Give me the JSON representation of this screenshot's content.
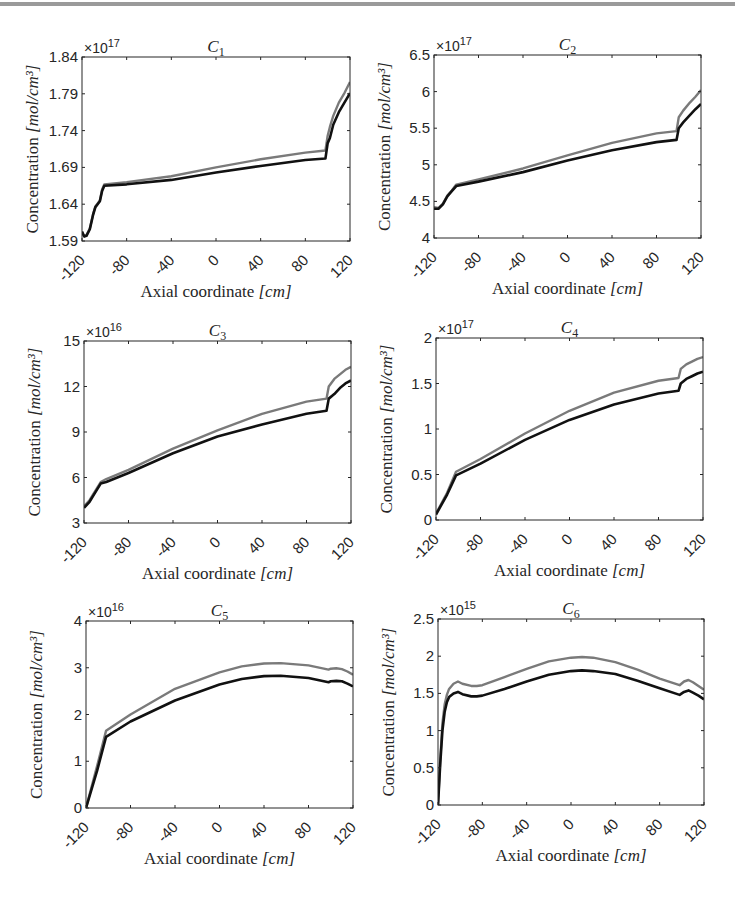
{
  "figure": {
    "xlabel": "Axial coordinate [cm]",
    "xlabel_main": "Axial coordinate ",
    "xlabel_unit": "[cm]",
    "ylabel": "Concentration [mol/cm³]",
    "ylabel_main": "Concentration ",
    "ylabel_unit": "[mol/cm³]",
    "series_colors": {
      "upper": "#7a7a7a",
      "lower": "#111111"
    }
  },
  "chart_data": [
    {
      "type": "line",
      "title": "C1",
      "title_sub": "1",
      "xlabel": "Axial coordinate [cm]",
      "ylabel": "Concentration [mol/cm^3]",
      "exponent": "×10^17",
      "exp_power": "17",
      "xlim": [
        -120,
        120
      ],
      "ylim": [
        1.59,
        1.84
      ],
      "xticks": [
        -120,
        -80,
        -40,
        0,
        40,
        80,
        120
      ],
      "yticks": [
        1.59,
        1.64,
        1.69,
        1.74,
        1.79,
        1.84
      ],
      "ytick_labels": [
        "1.59",
        "1.64",
        "1.69",
        "1.74",
        "1.79",
        "1.84"
      ],
      "box": [
        82,
        57,
        350,
        241
      ],
      "series": [
        {
          "name": "upper (gray)",
          "color": "#7a7a7a",
          "x": [
            -120,
            -118,
            -116,
            -113,
            -110,
            -108,
            -106,
            -104,
            -102,
            -100,
            -80,
            -40,
            0,
            40,
            80,
            98,
            100,
            102,
            105,
            110,
            115,
            120
          ],
          "y": [
            1.601,
            1.597,
            1.598,
            1.607,
            1.627,
            1.637,
            1.641,
            1.645,
            1.66,
            1.667,
            1.67,
            1.678,
            1.69,
            1.701,
            1.71,
            1.713,
            1.733,
            1.745,
            1.76,
            1.778,
            1.791,
            1.806
          ]
        },
        {
          "name": "lower (black)",
          "color": "#111111",
          "x": [
            -120,
            -118,
            -116,
            -113,
            -110,
            -108,
            -106,
            -104,
            -102,
            -100,
            -80,
            -40,
            0,
            40,
            80,
            98,
            100,
            102,
            105,
            110,
            115,
            120
          ],
          "y": [
            1.603,
            1.596,
            1.597,
            1.606,
            1.626,
            1.636,
            1.64,
            1.644,
            1.658,
            1.665,
            1.667,
            1.673,
            1.683,
            1.692,
            1.7,
            1.702,
            1.723,
            1.73,
            1.748,
            1.765,
            1.778,
            1.791
          ]
        }
      ]
    },
    {
      "type": "line",
      "title": "C2",
      "title_sub": "2",
      "xlabel": "Axial coordinate [cm]",
      "ylabel": "Concentration [mol/cm^3]",
      "exponent": "×10^17",
      "exp_power": "17",
      "xlim": [
        -120,
        120
      ],
      "ylim": [
        4,
        6.5
      ],
      "xticks": [
        -120,
        -80,
        -40,
        0,
        40,
        80,
        120
      ],
      "yticks": [
        4,
        4.5,
        5,
        5.5,
        6,
        6.5
      ],
      "ytick_labels": [
        "4",
        "4.5",
        "5",
        "5.5",
        "6",
        "6.5"
      ],
      "box": [
        434,
        55,
        701,
        238
      ],
      "series": [
        {
          "name": "upper (gray)",
          "color": "#7a7a7a",
          "x": [
            -120,
            -116,
            -112,
            -108,
            -104,
            -100,
            -80,
            -40,
            0,
            40,
            80,
            98,
            100,
            104,
            110,
            115,
            120
          ],
          "y": [
            4.42,
            4.41,
            4.47,
            4.58,
            4.65,
            4.73,
            4.8,
            4.95,
            5.13,
            5.3,
            5.43,
            5.46,
            5.65,
            5.74,
            5.85,
            5.93,
            6.02
          ]
        },
        {
          "name": "lower (black)",
          "color": "#111111",
          "x": [
            -120,
            -116,
            -112,
            -108,
            -104,
            -100,
            -80,
            -40,
            0,
            40,
            80,
            98,
            100,
            104,
            110,
            115,
            120
          ],
          "y": [
            4.4,
            4.4,
            4.46,
            4.57,
            4.64,
            4.71,
            4.77,
            4.9,
            5.06,
            5.2,
            5.31,
            5.34,
            5.5,
            5.58,
            5.68,
            5.76,
            5.83
          ]
        }
      ]
    },
    {
      "type": "line",
      "title": "C3",
      "title_sub": "3",
      "xlabel": "Axial coordinate [cm]",
      "ylabel": "Concentration [mol/cm^3]",
      "exponent": "×10^16",
      "exp_power": "16",
      "xlim": [
        -120,
        120
      ],
      "ylim": [
        3,
        15
      ],
      "xticks": [
        -120,
        -80,
        -40,
        0,
        40,
        80,
        120
      ],
      "yticks": [
        3,
        6,
        9,
        12,
        15
      ],
      "ytick_labels": [
        "3",
        "6",
        "9",
        "12",
        "15"
      ],
      "box": [
        84,
        341,
        351,
        523
      ],
      "series": [
        {
          "name": "upper (gray)",
          "color": "#7a7a7a",
          "x": [
            -120,
            -115,
            -110,
            -105,
            -100,
            -80,
            -40,
            0,
            40,
            80,
            98,
            100,
            105,
            110,
            115,
            120
          ],
          "y": [
            4.1,
            4.5,
            5.1,
            5.7,
            5.9,
            6.5,
            7.9,
            9.1,
            10.2,
            11.0,
            11.2,
            12.0,
            12.5,
            12.8,
            13.1,
            13.3
          ]
        },
        {
          "name": "lower (black)",
          "color": "#111111",
          "x": [
            -120,
            -115,
            -110,
            -105,
            -100,
            -80,
            -40,
            0,
            40,
            80,
            98,
            100,
            105,
            110,
            115,
            120
          ],
          "y": [
            4.0,
            4.4,
            5.0,
            5.6,
            5.7,
            6.3,
            7.6,
            8.7,
            9.5,
            10.2,
            10.4,
            11.2,
            11.5,
            11.9,
            12.2,
            12.4
          ]
        }
      ]
    },
    {
      "type": "line",
      "title": "C4",
      "title_sub": "4",
      "xlabel": "Axial coordinate [cm]",
      "ylabel": "Concentration [mol/cm^3]",
      "exponent": "×10^17",
      "exp_power": "17",
      "xlim": [
        -120,
        120
      ],
      "ylim": [
        0,
        2
      ],
      "xticks": [
        -120,
        -80,
        -40,
        0,
        40,
        80,
        120
      ],
      "yticks": [
        0,
        0.5,
        1,
        1.5,
        2
      ],
      "ytick_labels": [
        "0",
        "0.5",
        "1",
        "1.5",
        "2"
      ],
      "box": [
        436,
        338,
        703,
        520
      ],
      "series": [
        {
          "name": "upper (gray)",
          "color": "#7a7a7a",
          "x": [
            -120,
            -110,
            -102,
            -80,
            -40,
            0,
            40,
            80,
            98,
            100,
            105,
            110,
            115,
            120
          ],
          "y": [
            0.07,
            0.3,
            0.53,
            0.67,
            0.95,
            1.2,
            1.4,
            1.53,
            1.56,
            1.66,
            1.71,
            1.74,
            1.77,
            1.79
          ]
        },
        {
          "name": "lower (black)",
          "color": "#111111",
          "x": [
            -120,
            -110,
            -102,
            -80,
            -40,
            0,
            40,
            80,
            98,
            100,
            105,
            110,
            115,
            120
          ],
          "y": [
            0.06,
            0.28,
            0.49,
            0.62,
            0.88,
            1.1,
            1.27,
            1.39,
            1.42,
            1.5,
            1.55,
            1.58,
            1.61,
            1.63
          ]
        }
      ]
    },
    {
      "type": "line",
      "title": "C5",
      "title_sub": "5",
      "xlabel": "Axial coordinate [cm]",
      "ylabel": "Concentration [mol/cm^3]",
      "exponent": "×10^16",
      "exp_power": "16",
      "xlim": [
        -120,
        120
      ],
      "ylim": [
        0,
        4
      ],
      "xticks": [
        -120,
        -80,
        -40,
        0,
        40,
        80,
        120
      ],
      "yticks": [
        0,
        1,
        2,
        3,
        4
      ],
      "ytick_labels": [
        "0",
        "1",
        "2",
        "3",
        "4"
      ],
      "box": [
        86,
        621,
        353,
        808
      ],
      "series": [
        {
          "name": "upper (gray)",
          "color": "#7a7a7a",
          "x": [
            -120,
            -110,
            -102,
            -80,
            -40,
            0,
            20,
            40,
            55,
            80,
            98,
            100,
            105,
            110,
            115,
            120
          ],
          "y": [
            0.0,
            0.9,
            1.65,
            2.0,
            2.55,
            2.9,
            3.03,
            3.09,
            3.1,
            3.05,
            2.96,
            2.98,
            2.99,
            2.97,
            2.92,
            2.85
          ]
        },
        {
          "name": "lower (black)",
          "color": "#111111",
          "x": [
            -120,
            -110,
            -102,
            -80,
            -40,
            0,
            20,
            40,
            55,
            80,
            98,
            100,
            105,
            110,
            115,
            120
          ],
          "y": [
            0.0,
            0.8,
            1.52,
            1.85,
            2.3,
            2.64,
            2.76,
            2.82,
            2.83,
            2.78,
            2.69,
            2.71,
            2.72,
            2.71,
            2.66,
            2.6
          ]
        }
      ]
    },
    {
      "type": "line",
      "title": "C6",
      "title_sub": "6",
      "xlabel": "Axial coordinate [cm]",
      "ylabel": "Concentration [mol/cm^3]",
      "exponent": "×10^15",
      "exp_power": "15",
      "xlim": [
        -120,
        120
      ],
      "ylim": [
        0,
        2.5
      ],
      "xticks": [
        -120,
        -80,
        -40,
        0,
        40,
        80,
        120
      ],
      "yticks": [
        0,
        0.5,
        1,
        1.5,
        2,
        2.5
      ],
      "ytick_labels": [
        "0",
        "0.5",
        "1",
        "1.5",
        "2",
        "2.5"
      ],
      "box": [
        438,
        619,
        704,
        805
      ],
      "series": [
        {
          "name": "upper (gray)",
          "color": "#7a7a7a",
          "x": [
            -120,
            -118,
            -116,
            -114,
            -112,
            -110,
            -106,
            -102,
            -98,
            -90,
            -85,
            -80,
            -60,
            -40,
            -20,
            0,
            10,
            20,
            40,
            60,
            80,
            98,
            102,
            106,
            110,
            115,
            120
          ],
          "y": [
            0.0,
            0.6,
            1.1,
            1.35,
            1.48,
            1.56,
            1.63,
            1.66,
            1.63,
            1.6,
            1.6,
            1.61,
            1.72,
            1.83,
            1.93,
            1.98,
            1.99,
            1.98,
            1.92,
            1.82,
            1.7,
            1.61,
            1.66,
            1.68,
            1.65,
            1.6,
            1.55
          ]
        },
        {
          "name": "lower (black)",
          "color": "#111111",
          "x": [
            -120,
            -118,
            -116,
            -114,
            -112,
            -110,
            -106,
            -102,
            -98,
            -90,
            -85,
            -80,
            -60,
            -40,
            -20,
            0,
            10,
            20,
            40,
            60,
            80,
            98,
            102,
            106,
            110,
            115,
            120
          ],
          "y": [
            0.0,
            0.55,
            1.0,
            1.25,
            1.38,
            1.45,
            1.5,
            1.52,
            1.49,
            1.46,
            1.46,
            1.47,
            1.56,
            1.66,
            1.75,
            1.8,
            1.81,
            1.8,
            1.76,
            1.67,
            1.57,
            1.48,
            1.52,
            1.54,
            1.51,
            1.47,
            1.42
          ]
        }
      ]
    }
  ]
}
